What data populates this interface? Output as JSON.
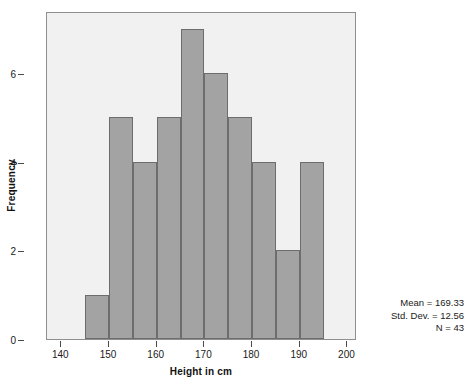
{
  "chart_data": {
    "type": "bar",
    "title": "",
    "subtitle": "",
    "xlabel": "Height in cm",
    "ylabel": "Frequency",
    "xlim": [
      137,
      202
    ],
    "ylim": [
      0,
      7.4
    ],
    "grid": false,
    "legend": null,
    "bin_width": 5,
    "bin_starts": [
      145,
      150,
      155,
      160,
      165,
      170,
      175,
      180,
      185,
      190
    ],
    "bin_ends": [
      150,
      155,
      160,
      165,
      170,
      175,
      180,
      185,
      190,
      195
    ],
    "categories": [
      "145-150",
      "150-155",
      "155-160",
      "160-165",
      "165-170",
      "170-175",
      "175-180",
      "180-185",
      "185-190",
      "190-195"
    ],
    "values": [
      1,
      5,
      4,
      5,
      7,
      6,
      5,
      4,
      2,
      4
    ],
    "xticks": [
      140,
      150,
      160,
      170,
      180,
      190,
      200
    ],
    "xtick_labels": [
      "140",
      "150",
      "160",
      "170",
      "180",
      "190",
      "200"
    ],
    "yticks": [
      0,
      2,
      4,
      6
    ],
    "ytick_labels": [
      "0",
      "2",
      "4",
      "6"
    ],
    "bar_color": "#a3a3a3",
    "bar_edge_color": "#6d6d6d",
    "plot_background": "#f1f1f1",
    "annotations": [
      "Mean = 169.33",
      "Std. Dev. = 12.56",
      "N = 43"
    ]
  },
  "stats": {
    "mean_line": "Mean = 169.33",
    "stddev_line": "Std. Dev. = 12.56",
    "n_line": "N = 43"
  }
}
